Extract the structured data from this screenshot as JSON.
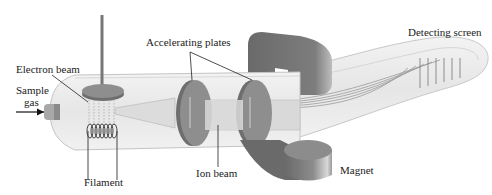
{
  "diagram": {
    "labels": {
      "accelerating_plates": "Accelerating plates",
      "detecting_screen": "Detecting screen",
      "electron_beam": "Electron beam",
      "sample_gas_line1": "Sample",
      "sample_gas_line2": "gas",
      "filament": "Filament",
      "ion_beam": "Ion beam",
      "magnet": "Magnet"
    },
    "colors": {
      "tube": "#ececec",
      "tube_edge": "#c8c8c8",
      "plate": "#8a8a8a",
      "plate_dark": "#6e6e6e",
      "magnet": "#7a7a7a",
      "magnet_dark": "#5a5a5a",
      "text": "#222222"
    }
  }
}
